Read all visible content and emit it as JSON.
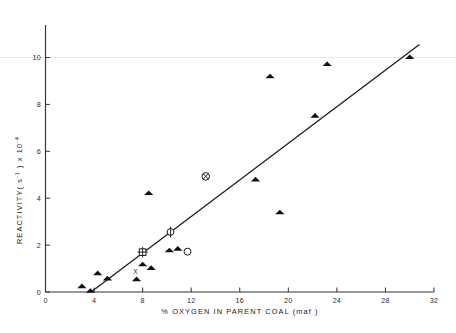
{
  "chart_data": {
    "type": "scatter",
    "title": "",
    "xlabel": "%  OXYGEN   IN  PARENT   COAL (maf )",
    "ylabel": "REACTIVITY( s⁻¹ ) x 10⁻⁴",
    "ylabel_parts": {
      "main": "REACTIVITY(",
      "sup1": "-1",
      "mid": "s",
      "tail": ") x 10",
      "sup2": "-4"
    },
    "xlim": [
      0,
      32
    ],
    "ylim": [
      0,
      11.6
    ],
    "xticks": [
      0,
      4,
      8,
      12,
      16,
      20,
      24,
      28,
      32
    ],
    "xtick_labels": [
      "0",
      "4",
      "8",
      "12",
      "16",
      "20",
      "24",
      "28",
      "32"
    ],
    "yticks": [
      0,
      2,
      4,
      6,
      8,
      10
    ],
    "ytick_labels": [
      "0",
      "2",
      "4",
      "6",
      "8",
      "10"
    ],
    "grid": false,
    "legend": "none",
    "series": [
      {
        "name": "filled-triangle",
        "marker": "triangle",
        "points": [
          [
            3.0,
            0.25
          ],
          [
            3.7,
            0.05
          ],
          [
            4.3,
            0.8
          ],
          [
            5.1,
            0.58
          ],
          [
            7.5,
            0.55
          ],
          [
            8.0,
            1.18
          ],
          [
            8.7,
            1.03
          ],
          [
            8.5,
            4.22
          ],
          [
            10.2,
            1.78
          ],
          [
            10.9,
            1.85
          ],
          [
            17.3,
            4.8
          ],
          [
            18.5,
            9.2
          ],
          [
            19.3,
            3.4
          ],
          [
            22.2,
            7.52
          ],
          [
            23.2,
            9.72
          ],
          [
            30.0,
            10.02
          ]
        ]
      },
      {
        "name": "open-circle-with-tick",
        "marker": "circle-tick",
        "points": [
          [
            10.3,
            2.56
          ]
        ]
      },
      {
        "name": "open-square-with-cross",
        "marker": "square-cross",
        "points": [
          [
            8.0,
            1.7
          ]
        ]
      },
      {
        "name": "open-circle",
        "marker": "circle",
        "points": [
          [
            11.7,
            1.72
          ]
        ]
      },
      {
        "name": "circled-cross",
        "marker": "circle-x",
        "points": [
          [
            13.2,
            4.93
          ]
        ]
      },
      {
        "name": "x-mark",
        "marker": "x",
        "points": [
          [
            7.4,
            0.85
          ]
        ]
      }
    ],
    "fit_line": {
      "name": "regression-line",
      "x_start": 3.75,
      "y_start": 0.0,
      "x_end": 30.8,
      "y_end": 10.55
    }
  },
  "colors": {
    "axis": "#333333",
    "marker": "#111111",
    "line": "#1a1a1a",
    "background": "#ffffff"
  }
}
